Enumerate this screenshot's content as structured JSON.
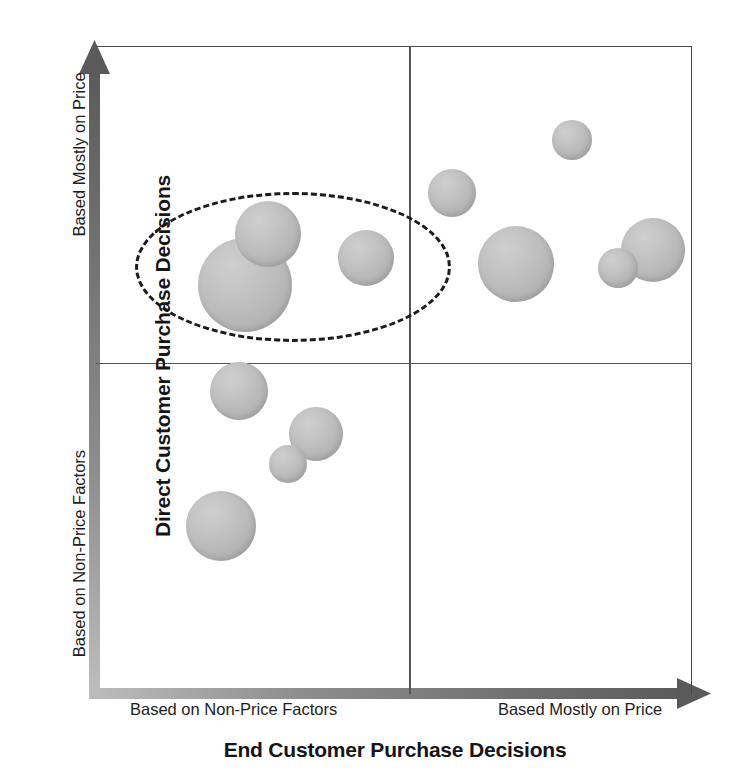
{
  "chart_data": {
    "type": "scatter",
    "title": "",
    "xlabel": "End Customer Purchase Decisions",
    "ylabel": "Direct Customer Purchase Decisions",
    "xtick_labels": [
      "Based on Non-Price Factors",
      "Based Mostly on Price"
    ],
    "ytick_labels": [
      "Based on Non-Price Factors",
      "Based Mostly on Price"
    ],
    "xlim": [
      0,
      100
    ],
    "ylim": [
      0,
      100
    ],
    "grid": false,
    "legend": "none",
    "quadrant_divider_x": 52,
    "quadrant_divider_y": 51,
    "bubble_color": "#bbbbbb",
    "axis_color": "#5a5a5a",
    "border_color": "#4a4a4a",
    "annotation_color": "#1b1b1b",
    "annotations": [
      {
        "name": "highlight-ellipse",
        "shape": "dashed-ellipse",
        "cx": 293,
        "cy": 267,
        "rx": 158,
        "ry": 75
      }
    ],
    "points": [
      {
        "id": "p1",
        "quadrant": "upper-left",
        "cx": 245,
        "cy": 285,
        "r": 47
      },
      {
        "id": "p2",
        "quadrant": "upper-left",
        "cx": 268,
        "cy": 234,
        "r": 33
      },
      {
        "id": "p3",
        "quadrant": "upper-left",
        "cx": 366,
        "cy": 258,
        "r": 28
      },
      {
        "id": "p4",
        "quadrant": "upper-right",
        "cx": 452,
        "cy": 193,
        "r": 24
      },
      {
        "id": "p5",
        "quadrant": "upper-right",
        "cx": 572,
        "cy": 140,
        "r": 20
      },
      {
        "id": "p6",
        "quadrant": "upper-right",
        "cx": 516,
        "cy": 264,
        "r": 38
      },
      {
        "id": "p7",
        "quadrant": "upper-right",
        "cx": 653,
        "cy": 250,
        "r": 32
      },
      {
        "id": "p8",
        "quadrant": "upper-right",
        "cx": 618,
        "cy": 268,
        "r": 20
      },
      {
        "id": "p9",
        "quadrant": "lower-left",
        "cx": 239,
        "cy": 391,
        "r": 29
      },
      {
        "id": "p10",
        "quadrant": "lower-left",
        "cx": 316,
        "cy": 434,
        "r": 27
      },
      {
        "id": "p11",
        "quadrant": "lower-left",
        "cx": 288,
        "cy": 464,
        "r": 19
      },
      {
        "id": "p12",
        "quadrant": "lower-left",
        "cx": 221,
        "cy": 526,
        "r": 35
      }
    ]
  },
  "axes": {
    "y_title": "Direct Customer Purchase Decisions",
    "y_label_top": "Based Mostly on Price",
    "y_label_bottom": "Based on Non-Price Factors",
    "x_title": "End Customer Purchase Decisions",
    "x_label_left": "Based on Non-Price Factors",
    "x_label_right": "Based Mostly on Price"
  }
}
